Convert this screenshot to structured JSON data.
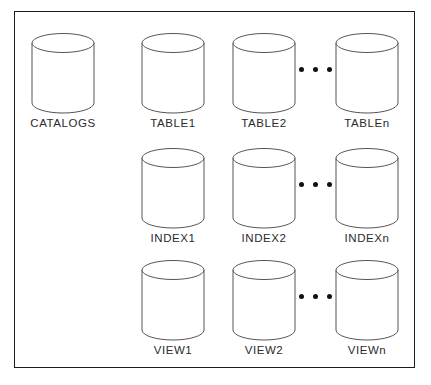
{
  "diagram": {
    "border_color": "#1c1c1c",
    "shape_stroke_color": "#555555",
    "background_color": "#ffffff",
    "label_color": "#2b2b2b",
    "dot_color": "#111111",
    "ellipsis_glyph": "• • •",
    "rows": [
      {
        "name": "catalogs-row",
        "nodes": [
          {
            "label": "CATALOGS",
            "shape": "cylinder"
          },
          {
            "label": "TABLE1",
            "shape": "cylinder"
          },
          {
            "label": "TABLE2",
            "shape": "cylinder"
          },
          {
            "label": "TABLEn",
            "shape": "cylinder"
          }
        ],
        "has_ellipsis": true
      },
      {
        "name": "index-row",
        "nodes": [
          {
            "label": "INDEX1",
            "shape": "cylinder"
          },
          {
            "label": "INDEX2",
            "shape": "cylinder"
          },
          {
            "label": "INDEXn",
            "shape": "cylinder"
          }
        ],
        "has_ellipsis": true
      },
      {
        "name": "view-row",
        "nodes": [
          {
            "label": "VIEW1",
            "shape": "cylinder"
          },
          {
            "label": "VIEW2",
            "shape": "cylinder"
          },
          {
            "label": "VIEWn",
            "shape": "cylinder"
          }
        ],
        "has_ellipsis": true
      }
    ]
  }
}
